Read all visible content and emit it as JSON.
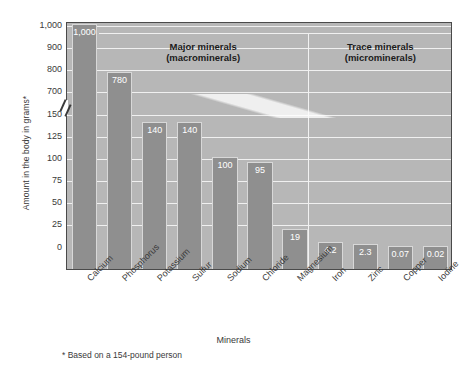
{
  "chart_data": {
    "type": "bar",
    "title": "",
    "xlabel": "Minerals",
    "ylabel": "Amount in the body in grams*",
    "footnote": "* Based on a 154-pound person",
    "grid": true,
    "legend_position": "none",
    "axis_break": {
      "below": 150,
      "above": 700,
      "note": "y-axis broken between 150 and 700"
    },
    "yticks": [
      "1,000",
      "900",
      "800",
      "700",
      "150",
      "125",
      "100",
      "75",
      "50",
      "25",
      "0"
    ],
    "ylim_lower": [
      0,
      150
    ],
    "ylim_upper": [
      700,
      1000
    ],
    "categories": [
      "Calcium",
      "Phosphorus",
      "Potassium",
      "Sulfur",
      "Sodium",
      "Chloride",
      "Magnesium",
      "Iron",
      "Zinc",
      "Copper",
      "Iodine"
    ],
    "values": [
      1000,
      780,
      140,
      140,
      100,
      95,
      19,
      4.2,
      2.3,
      0.07,
      0.02
    ],
    "value_labels": [
      "1,000",
      "780",
      "140",
      "140",
      "100",
      "95",
      "19",
      "4.2",
      "2.3",
      "0.07",
      "0.02"
    ],
    "groups": [
      {
        "label_line1": "Major minerals",
        "label_line2": "(macrominerals)",
        "categories": [
          "Calcium",
          "Phosphorus",
          "Potassium",
          "Sulfur",
          "Sodium",
          "Chloride",
          "Magnesium"
        ]
      },
      {
        "label_line1": "Trace minerals",
        "label_line2": "(microminerals)",
        "categories": [
          "Iron",
          "Zinc",
          "Copper",
          "Iodine"
        ]
      }
    ],
    "colors": {
      "plot_background": "#b7b7b7",
      "bar_fill": "#8f8f8f",
      "gridline": "#f0f0f0",
      "axis": "#4a4a4a",
      "value_label": "#ffffff",
      "text": "#3a3a3a"
    }
  }
}
